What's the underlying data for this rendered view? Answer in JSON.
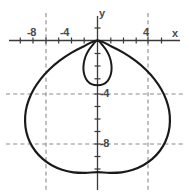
{
  "figure": {
    "title": "",
    "background_color": "#ffffff",
    "width": 189,
    "height": 196
  },
  "axes": {
    "x_axis_label": "x",
    "y_axis_label": "y",
    "axis_color": "#3a3a3a",
    "grid_color": "#8a8a8a",
    "curve_color": "#1a1a1a",
    "x_tick_labels": [
      "-8",
      "-4",
      "4"
    ],
    "y_tick_labels": [
      "-4",
      "-8"
    ]
  },
  "labels": {
    "x_neg8": "-8",
    "x_neg4": "-4",
    "x_pos4": "4",
    "y_neg4": "-4",
    "y_neg8": "-8",
    "axis_x": "x",
    "axis_y": "y"
  },
  "chart_data": {
    "type": "line",
    "plot_kind": "polar-limacon",
    "title": "",
    "xlabel": "x",
    "ylabel": "y",
    "equation": "r = 2 + 4 sin(theta), plotted inverted (loop above, body below)",
    "xlim": [
      -8.6,
      7.4
    ],
    "ylim": [
      -12.2,
      3.2
    ],
    "xticks": [
      -8,
      -4,
      0,
      4
    ],
    "xticklabels": [
      "-8",
      "-4",
      "",
      "4"
    ],
    "yticks": [
      -4,
      -8
    ],
    "yticklabels": [
      "-4",
      "-8"
    ],
    "grid": true,
    "grid_style": "dashed",
    "gridlines_x": [
      -4,
      4
    ],
    "gridlines_y": [
      -4,
      -8
    ],
    "legend": null,
    "legend_position": "none",
    "curve_params": {
      "a": 2,
      "b": 4,
      "orientation": "down"
    },
    "features": {
      "origin": [
        0,
        0
      ],
      "node_point": [
        0,
        0
      ],
      "outer_extent_left": [
        -5.6,
        -4.0
      ],
      "outer_extent_right": [
        5.6,
        -4.0
      ],
      "outer_bottom": [
        0,
        -9.0
      ],
      "inner_loop_bottom": [
        0,
        -2.9
      ],
      "inner_loop_half_width": 1.05
    },
    "series": [
      {
        "name": "limacon-outer",
        "theta_range_deg": [
          -30,
          210
        ],
        "points": [
          [
            0.0,
            0.0
          ],
          [
            -1.06,
            -0.45
          ],
          [
            -2.06,
            -0.98
          ],
          [
            -2.97,
            -1.6
          ],
          [
            -3.78,
            -2.3
          ],
          [
            -4.46,
            -3.06
          ],
          [
            -5.0,
            -3.87
          ],
          [
            -5.39,
            -4.71
          ],
          [
            -5.62,
            -5.57
          ],
          [
            -5.68,
            -6.43
          ],
          [
            -5.58,
            -7.27
          ],
          [
            -5.31,
            -8.05
          ],
          [
            -4.88,
            -8.77
          ],
          [
            -4.3,
            -9.4
          ],
          [
            -3.59,
            -9.9
          ],
          [
            -2.78,
            -10.26
          ],
          [
            -1.9,
            -10.46
          ],
          [
            -0.96,
            -10.5
          ],
          [
            0.0,
            -10.45
          ],
          [
            0.96,
            -10.5
          ],
          [
            1.9,
            -10.46
          ],
          [
            2.78,
            -10.26
          ],
          [
            3.59,
            -9.9
          ],
          [
            4.3,
            -9.4
          ],
          [
            4.88,
            -8.77
          ],
          [
            5.31,
            -8.05
          ],
          [
            5.58,
            -7.27
          ],
          [
            5.68,
            -6.43
          ],
          [
            5.62,
            -5.57
          ],
          [
            5.39,
            -4.71
          ],
          [
            5.0,
            -3.87
          ],
          [
            4.46,
            -3.06
          ],
          [
            3.78,
            -2.3
          ],
          [
            2.97,
            -1.6
          ],
          [
            2.06,
            -0.98
          ],
          [
            1.06,
            -0.45
          ],
          [
            0.0,
            0.0
          ]
        ]
      },
      {
        "name": "limacon-inner-loop",
        "theta_range_deg": [
          210,
          330
        ],
        "points": [
          [
            0.0,
            0.0
          ],
          [
            -0.42,
            -0.4
          ],
          [
            -0.74,
            -0.85
          ],
          [
            -0.96,
            -1.33
          ],
          [
            -1.08,
            -1.83
          ],
          [
            -1.1,
            -2.33
          ],
          [
            -1.01,
            -2.8
          ],
          [
            -0.8,
            -3.2
          ],
          [
            -0.47,
            -3.46
          ],
          [
            0.0,
            -3.55
          ],
          [
            0.47,
            -3.46
          ],
          [
            0.8,
            -3.2
          ],
          [
            1.01,
            -2.8
          ],
          [
            1.1,
            -2.33
          ],
          [
            1.08,
            -1.83
          ],
          [
            0.96,
            -1.33
          ],
          [
            0.74,
            -0.85
          ],
          [
            0.42,
            -0.4
          ],
          [
            0.0,
            0.0
          ]
        ]
      }
    ]
  }
}
